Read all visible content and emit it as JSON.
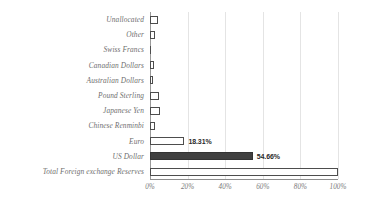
{
  "chart_data": {
    "type": "bar",
    "orientation": "horizontal",
    "title": "",
    "subtitle": "",
    "xlabel": "",
    "ylabel": "",
    "xlim": [
      0,
      100
    ],
    "grid": true,
    "legend": "none",
    "xticks": [
      "0%",
      "20%",
      "40%",
      "60%",
      "80%",
      "100%"
    ],
    "xtick_values": [
      0,
      20,
      40,
      60,
      80,
      100
    ],
    "categories": [
      "Unallocated",
      "Other",
      "Swiss Francs",
      "Canadian Dollars",
      "Australian Dollars",
      "Pound Sterling",
      "Japanese Yen",
      "Chinese Renminbi",
      "Euro",
      "US Dollar",
      "Total Foreign exchange Reserves"
    ],
    "values": [
      4.5,
      2.5,
      0.2,
      2.3,
      1.8,
      4.9,
      5.5,
      2.6,
      18.31,
      54.66,
      100
    ],
    "data_labels": [
      "",
      "",
      "",
      "",
      "",
      "",
      "",
      "",
      "18.31%",
      "54.66%",
      ""
    ],
    "bar_styles": [
      "outline",
      "outline",
      "outline",
      "outline",
      "outline",
      "outline",
      "outline",
      "outline",
      "outline",
      "filled",
      "outline"
    ],
    "colors": {
      "bar_fill": "#404040",
      "bar_outline": "#4d4d4d",
      "bar_background": "#ffffff",
      "gridline": "#e4e4e4",
      "axis": "#8d8d8d",
      "label_text": "#6f6f6f",
      "value_text": "#2b2b2b"
    }
  }
}
